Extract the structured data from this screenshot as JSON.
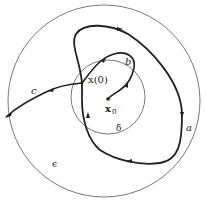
{
  "diagram": {
    "type": "stability-regions",
    "colors": {
      "stroke": "#222222",
      "thin": "#555555",
      "background": "#ffffff"
    },
    "regions": [
      {
        "id": "outer",
        "label": "ϵ",
        "cx": 104,
        "cy": 101,
        "r": 96
      },
      {
        "id": "inner",
        "label": "δ",
        "cx": 108,
        "cy": 97,
        "r": 37
      }
    ],
    "points": [
      {
        "id": "equilibrium",
        "label": "x",
        "subscript": "0",
        "x": 108,
        "y": 99
      },
      {
        "id": "initial",
        "label": "x(0)",
        "x": 82,
        "y": 83
      }
    ],
    "trajectories": [
      {
        "id": "a",
        "label": "a"
      },
      {
        "id": "b",
        "label": "b"
      },
      {
        "id": "c",
        "label": "c"
      }
    ]
  }
}
